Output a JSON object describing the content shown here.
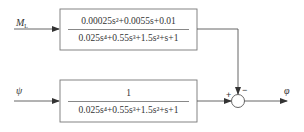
{
  "diagram": {
    "type": "block-diagram",
    "inputs": [
      {
        "id": "ML",
        "label": "M",
        "subscript": "L"
      },
      {
        "id": "psi",
        "label": "ψ"
      }
    ],
    "blocks": [
      {
        "id": "G1",
        "numerator": "0.00025s²+0.0055s+0.01",
        "denominator": "0.025s⁴+0.55s³+1.5s²+s+1"
      },
      {
        "id": "G2",
        "numerator": "1",
        "denominator": "0.025s⁴+0.55s³+1.5s²+s+1"
      }
    ],
    "summing_junction": {
      "plus_sign": "+",
      "minus_sign": "−"
    },
    "output": {
      "label": "φ"
    }
  },
  "colors": {
    "stroke": "#555555",
    "text": "#333333",
    "background": "#ffffff"
  }
}
